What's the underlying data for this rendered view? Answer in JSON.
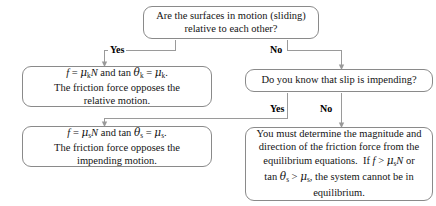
{
  "diagram": {
    "line_color": "#9a9a9a",
    "border_color": "#8a8a8a",
    "text_color": "#141414"
  },
  "nodes": {
    "question_sliding": {
      "line1": "Are the surfaces in motion (sliding)",
      "line2": "relative to each other?"
    },
    "kinetic_result": {
      "equation": "f = μkN and tan θk = μk.",
      "line2": "The friction force opposes the",
      "line3": "relative motion."
    },
    "question_impending": {
      "line1": "Do you know that slip is impending?"
    },
    "static_result": {
      "equation": "f = μsN and tan θs = μs.",
      "line2": "The friction force opposes the",
      "line3": "impending motion."
    },
    "equilibrium_result": {
      "line1": "You must determine the magnitude and",
      "line2": "direction of the friction force from the",
      "line3": "equilibrium equations.  If f > μsN or",
      "line4": "tan θs > μs, the system cannot be in",
      "line5": "equilibrium."
    }
  },
  "edges": {
    "yes_sliding": "Yes",
    "no_sliding": "No",
    "yes_impending": "Yes",
    "no_impending": "No"
  }
}
